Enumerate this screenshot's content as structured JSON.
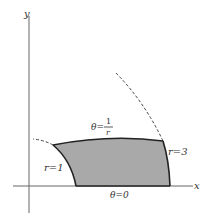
{
  "diagram": {
    "type": "polar-region",
    "axes": {
      "x_label": "x",
      "y_label": "y"
    },
    "labels": {
      "inner_arc": "r=1",
      "outer_arc": "r=3",
      "bottom_edge": "θ=0",
      "top_edge_prefix": "θ=",
      "top_edge_num": "1",
      "top_edge_den": "r"
    },
    "colors": {
      "region_fill": "#a9a9a9",
      "stroke": "#222222",
      "axis": "#555555",
      "dashed": "#444444"
    }
  }
}
